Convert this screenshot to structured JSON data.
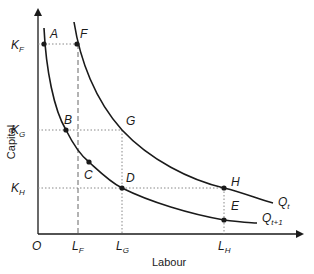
{
  "diagram": {
    "type": "isoquant-map",
    "axes": {
      "x_label": "Labour",
      "y_label": "Capital",
      "origin_label": "O"
    },
    "x_ticks": [
      {
        "main": "L",
        "sub": "F"
      },
      {
        "main": "L",
        "sub": "G"
      },
      {
        "main": "L",
        "sub": "H"
      }
    ],
    "y_ticks": [
      {
        "main": "K",
        "sub": "F"
      },
      {
        "main": "K",
        "sub": "G"
      },
      {
        "main": "K",
        "sub": "H"
      }
    ],
    "curves": [
      {
        "name": "Q",
        "sub": "t",
        "label": "Qt"
      },
      {
        "name": "Q",
        "sub": "t+1",
        "label": "Qt+1"
      }
    ],
    "points": {
      "A": "A",
      "B": "B",
      "C": "C",
      "D": "D",
      "E": "E",
      "F": "F",
      "G": "G",
      "H": "H"
    },
    "colors": {
      "line": "#1a1a1a",
      "guide": "#777777",
      "background": "#ffffff"
    }
  }
}
